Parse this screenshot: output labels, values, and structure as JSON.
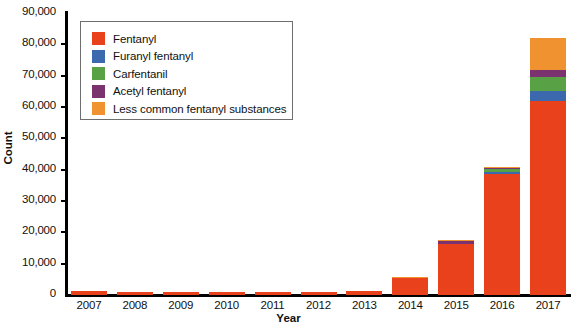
{
  "chart_data": {
    "type": "bar",
    "subtype": "stacked",
    "title": "",
    "xlabel": "Year",
    "ylabel": "Count",
    "categories": [
      "2007",
      "2008",
      "2009",
      "2010",
      "2011",
      "2012",
      "2013",
      "2014",
      "2015",
      "2016",
      "2017"
    ],
    "ylim": [
      0,
      90000
    ],
    "yticks": [
      0,
      10000,
      20000,
      30000,
      40000,
      50000,
      60000,
      70000,
      80000,
      90000
    ],
    "ytick_labels": [
      "0",
      "10,000",
      "20,000",
      "30,000",
      "40,000",
      "50,000",
      "60,000",
      "70,000",
      "80,000",
      "90,000"
    ],
    "grid": false,
    "legend_position": "upper-left-inside",
    "series": [
      {
        "name": "Fentanyl",
        "color": "#E8411C",
        "values": [
          1200,
          1000,
          1100,
          1100,
          1000,
          1000,
          1300,
          5500,
          16200,
          38500,
          62000
        ]
      },
      {
        "name": "Furanyl fentanyl",
        "color": "#3C68AE",
        "values": [
          0,
          0,
          0,
          0,
          0,
          0,
          0,
          0,
          100,
          900,
          3200
        ]
      },
      {
        "name": "Carfentanil",
        "color": "#58A144",
        "values": [
          0,
          0,
          0,
          0,
          0,
          0,
          0,
          0,
          100,
          700,
          4500
        ]
      },
      {
        "name": "Acetyl fentanyl",
        "color": "#7B3370",
        "values": [
          0,
          0,
          0,
          0,
          0,
          0,
          0,
          0,
          800,
          600,
          2000
        ]
      },
      {
        "name": "Less common fentanyl substances",
        "color": "#F0922F",
        "values": [
          0,
          0,
          0,
          0,
          0,
          0,
          0,
          100,
          400,
          300,
          10200
        ]
      }
    ],
    "totals": [
      1200,
      1000,
      1100,
      1100,
      1000,
      1000,
      1300,
      5600,
      17600,
      41000,
      81900
    ]
  },
  "legend": {
    "items": [
      {
        "label": "Fentanyl",
        "color": "#E8411C"
      },
      {
        "label": "Furanyl fentanyl",
        "color": "#3C68AE"
      },
      {
        "label": "Carfentanil",
        "color": "#58A144"
      },
      {
        "label": "Acetyl fentanyl",
        "color": "#7B3370"
      },
      {
        "label": "Less common fentanyl substances",
        "color": "#F0922F"
      }
    ]
  },
  "axes": {
    "y_title": "Count",
    "x_title": "Year"
  }
}
